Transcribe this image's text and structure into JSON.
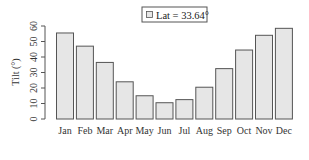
{
  "chart_data": {
    "type": "bar",
    "title": "",
    "xlabel": "",
    "ylabel": "Tilt (°)",
    "ylim": [
      0,
      60
    ],
    "yticks": [
      0,
      10,
      20,
      30,
      40,
      50,
      60
    ],
    "grid": false,
    "legend_position": "top-center",
    "categories": [
      "Jan",
      "Feb",
      "Mar",
      "Apr",
      "May",
      "Jun",
      "Jul",
      "Aug",
      "Sep",
      "Oct",
      "Nov",
      "Dec"
    ],
    "series": [
      {
        "name": "Lat = 33.64°",
        "values": [
          55.5,
          47,
          36.5,
          24,
          15,
          10.5,
          12.5,
          20.5,
          32.5,
          44.5,
          54,
          58.5
        ]
      }
    ],
    "colors": {
      "bar_fill": "#e6e6e6",
      "bar_stroke": "#555555",
      "axis": "#555555"
    }
  },
  "legend": {
    "label": "Lat = 33.64°"
  },
  "axis": {
    "ylabel": "Tilt (°)"
  }
}
